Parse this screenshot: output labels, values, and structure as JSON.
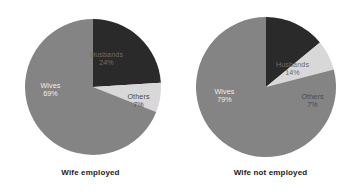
{
  "chart_data": [
    {
      "type": "pie",
      "title": "Wife employed",
      "labels": [
        "Husbands",
        "Others",
        "Wives"
      ],
      "values": [
        24,
        7,
        69
      ],
      "value_suffix": "%",
      "colors": [
        "#2a2a2a",
        "#d8d8d8",
        "#848484"
      ],
      "start_angle_deg": 0,
      "direction": "clockwise",
      "legend": "none",
      "grid": false,
      "slices": [
        {
          "label": "Husbands",
          "value": "24%",
          "color": "#2a2a2a"
        },
        {
          "label": "Others",
          "value": "7%",
          "color": "#d8d8d8"
        },
        {
          "label": "Wives",
          "value": "69%",
          "color": "#848484"
        }
      ]
    },
    {
      "type": "pie",
      "title": "Wife not employed",
      "labels": [
        "Husbands",
        "Others",
        "Wives"
      ],
      "values": [
        14,
        7,
        79
      ],
      "value_suffix": "%",
      "colors": [
        "#2a2a2a",
        "#d8d8d8",
        "#848484"
      ],
      "start_angle_deg": 0,
      "direction": "clockwise",
      "legend": "none",
      "grid": false,
      "slices": [
        {
          "label": "Husbands",
          "value": "14%",
          "color": "#2a2a2a"
        },
        {
          "label": "Others",
          "value": "7%",
          "color": "#d8d8d8"
        },
        {
          "label": "Wives",
          "value": "79%",
          "color": "#848484"
        }
      ]
    }
  ],
  "left": {
    "caption": "Wife employed",
    "husbands_label": "Husbands",
    "husbands_value": "24%",
    "others_label": "Others",
    "others_value": "7%",
    "wives_label": "Wives",
    "wives_value": "69%"
  },
  "right": {
    "caption": "Wife not employed",
    "husbands_label": "Husbands",
    "husbands_value": "14%",
    "others_label": "Others",
    "others_value": "7%",
    "wives_label": "Wives",
    "wives_value": "79%"
  },
  "colors": {
    "husbands": "#2a2a2a",
    "others": "#d8d8d8",
    "wives": "#848484",
    "background": "#ffffff",
    "caption_text": "#1b1b1b"
  }
}
